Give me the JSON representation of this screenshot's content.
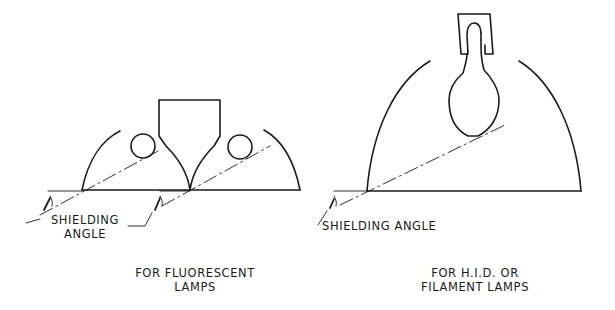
{
  "diagram": {
    "left": {
      "callout_line1": "SHIELDING",
      "callout_line2": "ANGLE",
      "caption_line1": "FOR FLUORESCENT",
      "caption_line2": "LAMPS"
    },
    "right": {
      "callout": "SHIELDING ANGLE",
      "caption_line1": "FOR H.I.D. OR",
      "caption_line2": "FILAMENT LAMPS"
    },
    "colors": {
      "stroke": "#1a1a1a",
      "background": "#ffffff"
    }
  }
}
